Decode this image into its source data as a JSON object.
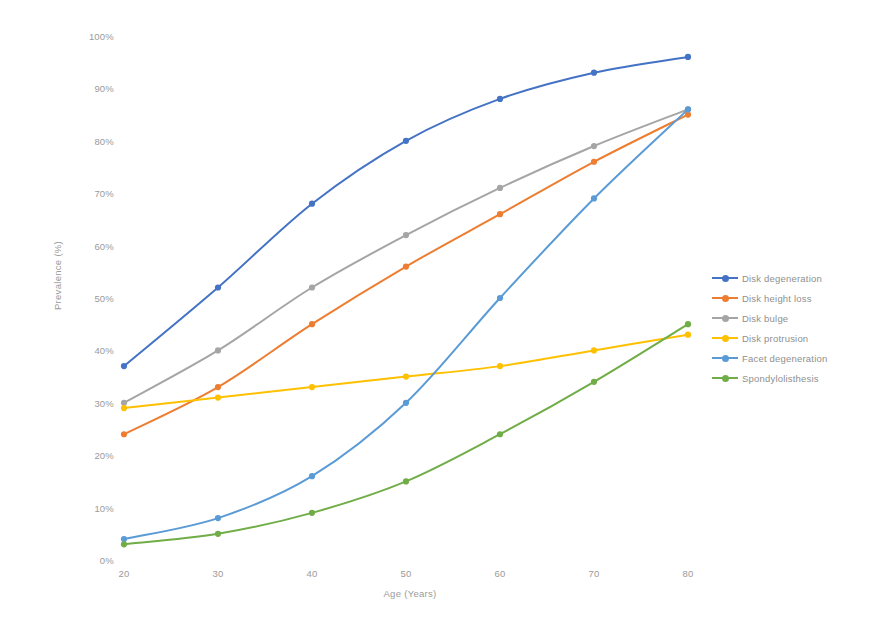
{
  "chart_data": {
    "type": "line",
    "title": "",
    "xlabel": "Age (Years)",
    "ylabel": "Prevalence (%)",
    "x": [
      20,
      30,
      40,
      50,
      60,
      70,
      80
    ],
    "categories": [
      "20",
      "30",
      "40",
      "50",
      "60",
      "70",
      "80"
    ],
    "xlim": [
      20,
      80
    ],
    "ylim": [
      0,
      100
    ],
    "yticks": [
      0,
      10,
      20,
      30,
      40,
      50,
      60,
      70,
      80,
      90,
      100
    ],
    "ytick_labels": [
      "0%",
      "10%",
      "20%",
      "30%",
      "40%",
      "50%",
      "60%",
      "70%",
      "80%",
      "90%",
      "100%"
    ],
    "xtick_labels": [
      "20",
      "30",
      "40",
      "50",
      "60",
      "70",
      "80"
    ],
    "grid": false,
    "legend_position": "right",
    "series": [
      {
        "name": "Disk degeneration",
        "color": "#4472C4",
        "values": [
          37,
          52,
          68,
          80,
          88,
          93,
          96
        ]
      },
      {
        "name": "Disk height loss",
        "color": "#ED7D31",
        "values": [
          24,
          33,
          45,
          56,
          66,
          76,
          85
        ]
      },
      {
        "name": "Disk bulge",
        "color": "#A5A5A5",
        "values": [
          30,
          40,
          52,
          62,
          71,
          79,
          86
        ]
      },
      {
        "name": "Disk protrusion",
        "color": "#FFC000",
        "values": [
          29,
          31,
          33,
          35,
          37,
          40,
          43
        ]
      },
      {
        "name": "Facet degeneration",
        "color": "#5B9BD5",
        "values": [
          4,
          8,
          16,
          30,
          50,
          69,
          86
        ]
      },
      {
        "name": "Spondylolisthesis",
        "color": "#70AD47",
        "values": [
          3,
          5,
          9,
          15,
          24,
          34,
          45
        ]
      }
    ]
  },
  "legend": {
    "items": [
      {
        "label": "Disk degeneration"
      },
      {
        "label": "Disk height loss"
      },
      {
        "label": "Disk bulge"
      },
      {
        "label": "Disk protrusion"
      },
      {
        "label": "Facet degeneration"
      },
      {
        "label": "Spondylolisthesis"
      }
    ]
  },
  "axes": {
    "x_title": "Age (Years)",
    "y_title": "Prevalence (%)"
  }
}
